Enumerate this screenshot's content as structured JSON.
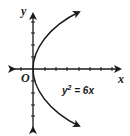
{
  "diagram": {
    "type": "coordinate-graph",
    "title": "",
    "axes": {
      "x_label": "x",
      "y_label": "y",
      "origin_label": "O",
      "x_ticks_positive": 7,
      "x_ticks_negative": 2,
      "y_ticks_positive": 5,
      "y_ticks_negative": 5
    },
    "curve": {
      "equation_label": "y² = 6x",
      "equation_base": "y",
      "equation_exponent": "2",
      "equation_rhs": " = 6x",
      "shape": "parabola opening right",
      "vertex": [
        0,
        0
      ]
    },
    "colors": {
      "stroke": "#1a1a1a",
      "background": "#ffffff"
    }
  }
}
